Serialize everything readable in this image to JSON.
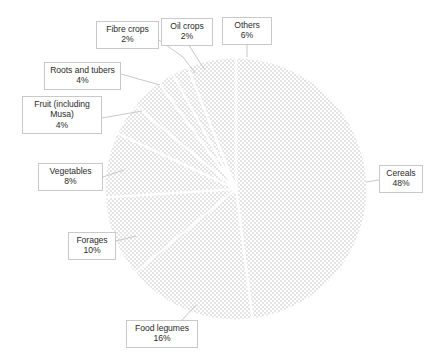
{
  "chart_data": {
    "type": "pie",
    "title": "",
    "subtitle": "",
    "xlabel": "",
    "ylabel": "",
    "legend_position": "none",
    "labels_show_percent": true,
    "start_angle_deg": 0,
    "direction": "clockwise",
    "categories": [
      "Cereals",
      "Food legumes",
      "Forages",
      "Vegetables",
      "Fruit (including Musa)",
      "Roots and tubers",
      "Fibre crops",
      "Oil crops",
      "Others"
    ],
    "values": [
      48,
      16,
      10,
      8,
      4,
      4,
      2,
      2,
      6
    ],
    "value_unit": "%",
    "slices": [
      {
        "name": "Cereals",
        "value": 48,
        "percent_text": "48%",
        "color": "#c5c5c5",
        "start_deg": 0.0,
        "end_deg": 172.8
      },
      {
        "name": "Food legumes",
        "value": 16,
        "percent_text": "16%",
        "color": "#c0c0c0",
        "start_deg": 172.8,
        "end_deg": 230.4
      },
      {
        "name": "Forages",
        "value": 10,
        "percent_text": "10%",
        "color": "#dcdcdc",
        "start_deg": 230.4,
        "end_deg": 266.4
      },
      {
        "name": "Vegetables",
        "value": 8,
        "percent_text": "8%",
        "color": "#d2d2d2",
        "start_deg": 266.4,
        "end_deg": 295.2
      },
      {
        "name": "Fruit (including Musa)",
        "value": 4,
        "percent_text": "4%",
        "color": "#dbdbdb",
        "start_deg": 295.2,
        "end_deg": 309.6
      },
      {
        "name": "Roots and tubers",
        "value": 4,
        "percent_text": "4%",
        "color": "#cfcfcf",
        "start_deg": 309.6,
        "end_deg": 324.0
      },
      {
        "name": "Fibre crops",
        "value": 2,
        "percent_text": "2%",
        "color": "#8a8a8a",
        "start_deg": 324.0,
        "end_deg": 331.2
      },
      {
        "name": "Oil crops",
        "value": 2,
        "percent_text": "2%",
        "color": "#9e9e9e",
        "start_deg": 331.2,
        "end_deg": 338.4
      },
      {
        "name": "Others",
        "value": 6,
        "percent_text": "6%",
        "color": "#a8a8a8",
        "start_deg": 338.4,
        "end_deg": 360.0
      }
    ]
  },
  "callouts": {
    "cereals": {
      "line1": "Cereals",
      "line2": "48%"
    },
    "food_legumes": {
      "line1": "Food legumes",
      "line2": "16%"
    },
    "forages": {
      "line1": "Forages",
      "line2": "10%"
    },
    "vegetables": {
      "line1": "Vegetables",
      "line2": "8%"
    },
    "fruit": {
      "line1": "Fruit (including",
      "line2": "Musa)",
      "line3": "4%"
    },
    "roots": {
      "line1": "Roots and tubers",
      "line2": "4%"
    },
    "fibre_crops": {
      "line1": "Fibre crops",
      "line2": "2%"
    },
    "oil_crops": {
      "line1": "Oil crops",
      "line2": "2%"
    },
    "others": {
      "line1": "Others",
      "line2": "6%"
    }
  },
  "style": {
    "background": "#ffffff",
    "slice_border": "#ffffff",
    "callout_border": "#c9c9c9",
    "text_color": "#2b2b2b"
  }
}
